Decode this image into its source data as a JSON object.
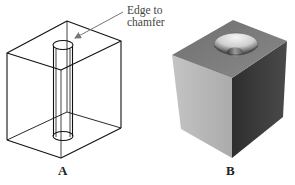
{
  "figure": {
    "panels": [
      {
        "id": "A",
        "label": "A",
        "style": "wireframe",
        "description": "Wireframe block with cylindrical through-hole"
      },
      {
        "id": "B",
        "label": "B",
        "style": "shaded",
        "description": "Shaded block with chamfered (countersunk) hole"
      }
    ],
    "callout": {
      "line1": "Edge to",
      "line2": "chamfer",
      "target_panel": "A"
    },
    "colors": {
      "wire": "#111111",
      "arrow": "#777777",
      "top_face": "#7d7d7d",
      "left_face": "#b9b9b9",
      "right_face": "#3c3c3c",
      "chamfer_light": "#e6e6e6",
      "chamfer_dark": "#4a4a4a"
    }
  }
}
